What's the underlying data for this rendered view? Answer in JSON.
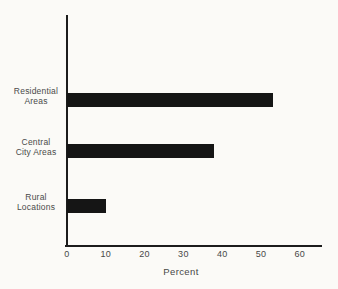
{
  "figure": {
    "background": "#fbfaf7",
    "bar_color": "#151515",
    "axis_color": "#1c1c1c",
    "text_color": "#4a4a4a"
  },
  "chart_data": {
    "type": "bar",
    "orientation": "horizontal",
    "title": "",
    "categories": [
      "Residential Areas",
      "Central City Areas",
      "Rural Locations"
    ],
    "category_lines": [
      [
        "Residential",
        "Areas"
      ],
      [
        "Central",
        "City Areas"
      ],
      [
        "Rural",
        "Locations"
      ]
    ],
    "values": [
      53,
      38,
      10
    ],
    "xlabel": "Percent",
    "ylabel": "",
    "xticks": [
      0,
      10,
      20,
      30,
      40,
      50,
      60
    ],
    "xlim": [
      0,
      60
    ],
    "grid": false,
    "legend": "none"
  }
}
